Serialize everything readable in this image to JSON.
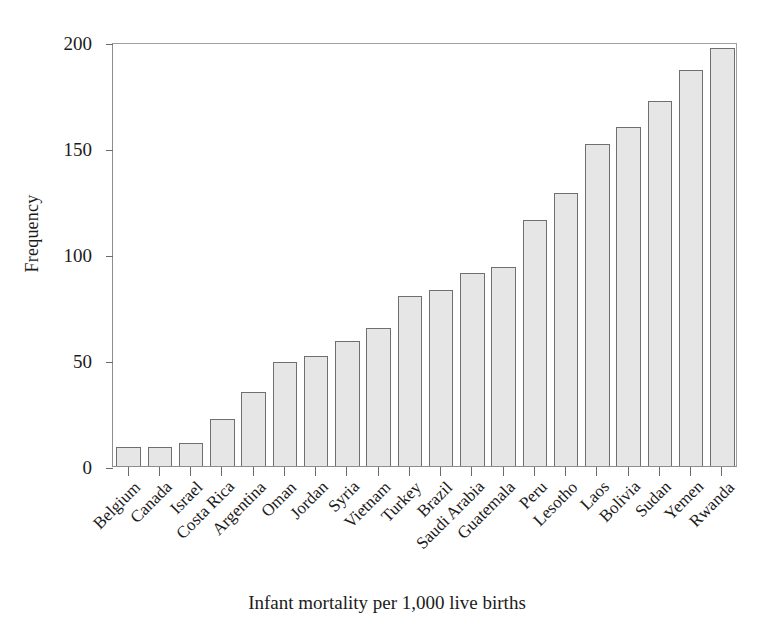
{
  "chart_data": {
    "type": "bar",
    "title": "",
    "xlabel": "Infant mortality per 1,000 live births",
    "ylabel": "Frequency",
    "categories": [
      "Belgium",
      "Canada",
      "Israel",
      "Costa Rica",
      "Argentina",
      "Oman",
      "Jordan",
      "Syria",
      "Vietnam",
      "Turkey",
      "Brazil",
      "Saudi Arabia",
      "Guatemala",
      "Peru",
      "Lesotho",
      "Laos",
      "Bolivia",
      "Sudan",
      "Yemen",
      "Rwanda"
    ],
    "values": [
      9,
      9,
      11,
      22,
      35,
      49,
      52,
      59,
      65,
      80,
      83,
      91,
      94,
      116,
      129,
      152,
      160,
      172,
      187,
      197
    ],
    "ylim": [
      0,
      200
    ],
    "yticks": [
      0,
      50,
      100,
      150,
      200
    ],
    "ytick_labels": [
      "0",
      "50",
      "100",
      "150",
      "200"
    ],
    "grid": false,
    "legend": false,
    "legend_position": "none",
    "bar_fill_color": "#e6e6e6",
    "bar_edge_color": "#6f6f6f",
    "axis_color": "#8d8d8d",
    "text_color": "#1b1b1b",
    "background_color": "#ffffff",
    "xtick_label_rotation": -45
  }
}
